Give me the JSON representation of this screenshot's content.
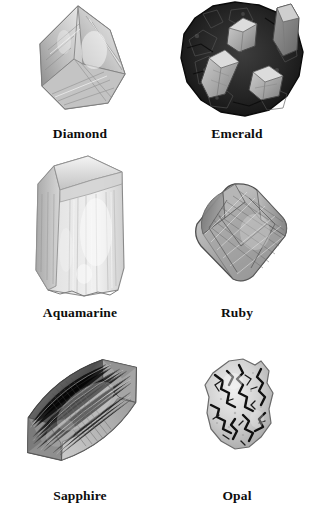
{
  "plate": {
    "background_color": "#ffffff",
    "columns": 2,
    "rows": 3,
    "caption_color": "#0d0d0d"
  },
  "specimens": [
    {
      "id": "diamond",
      "label": "Diamond",
      "icon_name": "diamond-crystal-image",
      "form": "octahedral faceted crystal",
      "tone": "light translucent gray",
      "body_color": "#c8c8c8",
      "shadow_color": "#8f8f8f",
      "highlight_color": "#f2f2f2"
    },
    {
      "id": "emerald",
      "label": "Emerald",
      "icon_name": "emerald-crystal-image",
      "form": "hexagonal prisms in dark matrix",
      "tone": "light crystals on near-black host rock",
      "body_color": "#2b2b2b",
      "shadow_color": "#141414",
      "highlight_color": "#b9b9b9"
    },
    {
      "id": "aquamarine",
      "label": "Aquamarine",
      "icon_name": "aquamarine-crystal-image",
      "form": "hexagonal prism with beveled termination",
      "tone": "very pale translucent gray",
      "body_color": "#d5d5d5",
      "shadow_color": "#9a9a9a",
      "highlight_color": "#f6f6f6"
    },
    {
      "id": "ruby",
      "label": "Ruby",
      "icon_name": "ruby-crystal-image",
      "form": "rounded bipyramidal crystal with striated faces",
      "tone": "medium gray with fine striations",
      "body_color": "#a9a9a9",
      "shadow_color": "#6d6d6d",
      "highlight_color": "#e3e3e3"
    },
    {
      "id": "sapphire",
      "label": "Sapphire",
      "icon_name": "sapphire-crystal-image",
      "form": "elongated barrel bipyramid, tilted diagonally",
      "tone": "medium-dark gray with horizontal striations",
      "body_color": "#a2a2a2",
      "shadow_color": "#565656",
      "highlight_color": "#d8d8d8"
    },
    {
      "id": "opal",
      "label": "Opal",
      "icon_name": "opal-nodule-image",
      "form": "irregular nodule with dark dendritic veining",
      "tone": "light body with black dendrites",
      "body_color": "#cfcfcf",
      "shadow_color": "#8a8a8a",
      "highlight_color": "#f0f0f0"
    }
  ]
}
